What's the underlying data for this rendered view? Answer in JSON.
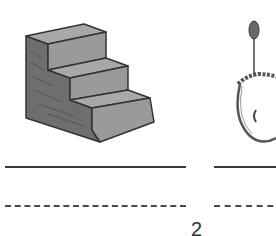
{
  "worksheet": {
    "items": [
      {
        "picture": "stairs-illustration",
        "answer_line_solid": "",
        "answer_line_dashed": ""
      },
      {
        "picture": "pendant-necklace-illustration",
        "answer_line_solid": "",
        "answer_line_dashed": ""
      }
    ],
    "page_number": "2"
  },
  "colors": {
    "stair_top": "#a8a8a8",
    "stair_front": "#9a9a9a",
    "stair_side": "#6e6e6e",
    "outline": "#333333",
    "line": "#3a3a3a"
  }
}
